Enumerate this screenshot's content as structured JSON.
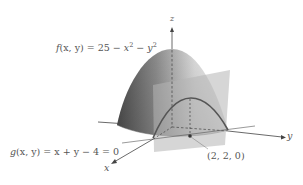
{
  "figure": {
    "type": "3d-surface-with-constraint",
    "surface_label": {
      "fn": "f",
      "args": "(x, y)",
      "eq": " = 25 − ",
      "t1": "x",
      "e1": "2",
      "mid": " − ",
      "t2": "y",
      "e2": "2"
    },
    "constraint_label": {
      "fn": "g",
      "args": "(x, y)",
      "eq": " = x + y − 4 = 0"
    },
    "point_label": "(2, 2, 0)",
    "axes": {
      "x": "x",
      "y": "y",
      "z": "z"
    },
    "colors": {
      "surface_dark": "#5f5f5f",
      "surface_light": "#e6e6e6",
      "plane": "#bdbdbd",
      "curve": "#555555",
      "axis": "#444444",
      "text": "#555555"
    }
  }
}
